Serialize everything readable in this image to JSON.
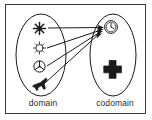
{
  "figure": {
    "type": "function-mapping-diagram",
    "title": "",
    "frame": {
      "border_color": "#3a3a3a",
      "background": "#ffffff"
    },
    "ink_color": "#1a1a1a"
  },
  "domain": {
    "label": "domain",
    "shape": "ellipse",
    "elements": [
      {
        "icon": "snowflake-icon",
        "glyph": "❇",
        "filled": true,
        "maps_to": "clock-icon"
      },
      {
        "icon": "sun-icon",
        "glyph": "☀",
        "filled": false,
        "maps_to": "clock-icon"
      },
      {
        "icon": "fan-icon",
        "glyph": "⊗",
        "filled": false,
        "maps_to": "clock-icon"
      },
      {
        "icon": "airplane-icon",
        "glyph": "✈",
        "filled": true,
        "maps_to": "clock-icon"
      }
    ]
  },
  "codomain": {
    "label": "codomain",
    "shape": "ellipse",
    "elements": [
      {
        "icon": "clock-icon",
        "glyph": "◷",
        "filled": false,
        "is_target": true
      },
      {
        "icon": "plus-icon",
        "glyph": "✚",
        "filled": true,
        "is_target": false
      }
    ]
  },
  "arrows": {
    "count": 4,
    "style": "solid-with-filled-arrowhead",
    "converge_point": "clock-icon",
    "color": "#1a1a1a"
  }
}
